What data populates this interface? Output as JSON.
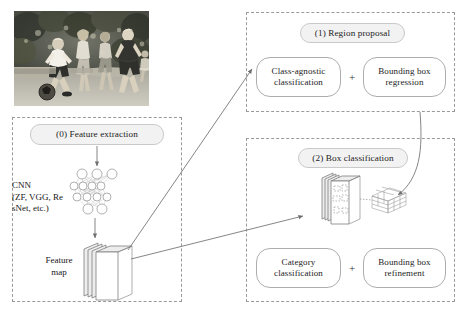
{
  "diagram": {
    "groups": [
      {
        "id": "feature-extraction",
        "header": "(0) Feature extraction"
      },
      {
        "id": "region-proposal",
        "header": "(1) Region proposal"
      },
      {
        "id": "box-classification",
        "header": "(2) Box classification"
      }
    ],
    "labels": {
      "cnn_line1": "CNN",
      "cnn_line2": "(ZF, VGG, Re",
      "cnn_line3": "sNet, etc.)",
      "feature_map_line1": "Feature",
      "feature_map_line2": "map"
    },
    "stage1": {
      "left_box": "Class-agnostic classification",
      "operator": "+",
      "right_box": "Bounding box regression"
    },
    "stage2": {
      "left_box": "Category classification",
      "operator": "+",
      "right_box": "Bounding box refinement"
    },
    "input_image": {
      "alt": "Grayscale photograph of children playing soccer on grass",
      "icon": "photo-icon"
    },
    "colors": {
      "dashed_border": "#9a9a9a",
      "pill_border": "#b5b5b5",
      "header_fill": "#f2f2f2",
      "arrow": "#6f6f6f",
      "text": "#1c1c1c",
      "canvas": "#ffffff"
    }
  }
}
